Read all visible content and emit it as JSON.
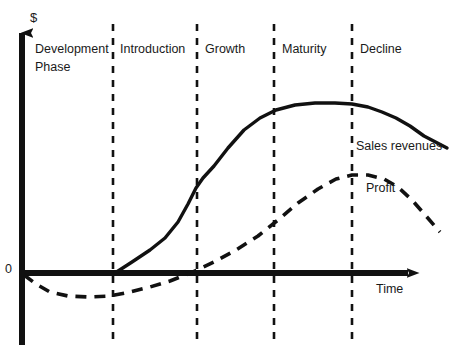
{
  "chart_data": {
    "type": "line",
    "xlabel": "Time",
    "ylabel": "$",
    "zero_label": "0",
    "grid": false,
    "legend_position": "inline-annotation",
    "phases": [
      {
        "label": "Development Phase",
        "line1": "Development",
        "line2": "Phase"
      },
      {
        "label": "Introduction",
        "line1": "Introduction",
        "line2": ""
      },
      {
        "label": "Growth",
        "line1": "Growth",
        "line2": ""
      },
      {
        "label": "Maturity",
        "line1": "Maturity",
        "line2": ""
      },
      {
        "label": "Decline",
        "line1": "Decline",
        "line2": ""
      }
    ],
    "series": [
      {
        "name": "Sales revenues",
        "style": "solid",
        "color": "#111111",
        "annotation": "Sales revenues",
        "points": [
          [
            115,
            273
          ],
          [
            132,
            262
          ],
          [
            150,
            250
          ],
          [
            165,
            238
          ],
          [
            178,
            222
          ],
          [
            188,
            204
          ],
          [
            196,
            188
          ],
          [
            203,
            178
          ],
          [
            214,
            166
          ],
          [
            228,
            148
          ],
          [
            244,
            130
          ],
          [
            260,
            118
          ],
          [
            276,
            110
          ],
          [
            295,
            105
          ],
          [
            315,
            103
          ],
          [
            335,
            103
          ],
          [
            352,
            104
          ],
          [
            368,
            107
          ],
          [
            382,
            112
          ],
          [
            396,
            118
          ],
          [
            410,
            126
          ],
          [
            424,
            136
          ],
          [
            447,
            148
          ]
        ]
      },
      {
        "name": "Profit",
        "style": "dashed",
        "color": "#111111",
        "annotation": "Profit",
        "points": [
          [
            24,
            275
          ],
          [
            36,
            284
          ],
          [
            50,
            292
          ],
          [
            68,
            296
          ],
          [
            88,
            297
          ],
          [
            110,
            296
          ],
          [
            130,
            292
          ],
          [
            150,
            287
          ],
          [
            170,
            281
          ],
          [
            193,
            272
          ],
          [
            214,
            262
          ],
          [
            236,
            250
          ],
          [
            258,
            236
          ],
          [
            278,
            220
          ],
          [
            298,
            203
          ],
          [
            318,
            189
          ],
          [
            336,
            179
          ],
          [
            352,
            175
          ],
          [
            368,
            175
          ],
          [
            384,
            179
          ],
          [
            398,
            187
          ],
          [
            412,
            200
          ],
          [
            426,
            216
          ],
          [
            440,
            232
          ]
        ]
      }
    ],
    "axes": {
      "y_axis_x": 22,
      "y_axis_top": 22,
      "y_axis_bottom": 345,
      "x_axis_y": 273,
      "x_axis_left": 22,
      "x_axis_right": 420
    },
    "dividers": [
      113,
      197,
      274,
      352
    ],
    "divider_top": 24,
    "divider_bottom": 340
  },
  "labels": {
    "y_axis": "$",
    "x_axis": "Time",
    "zero": "0",
    "phase_development_1": "Development",
    "phase_development_2": "Phase",
    "phase_introduction": "Introduction",
    "phase_growth": "Growth",
    "phase_maturity": "Maturity",
    "phase_decline": "Decline",
    "sales_annotation": "Sales revenues",
    "profit_annotation": "Profit"
  }
}
